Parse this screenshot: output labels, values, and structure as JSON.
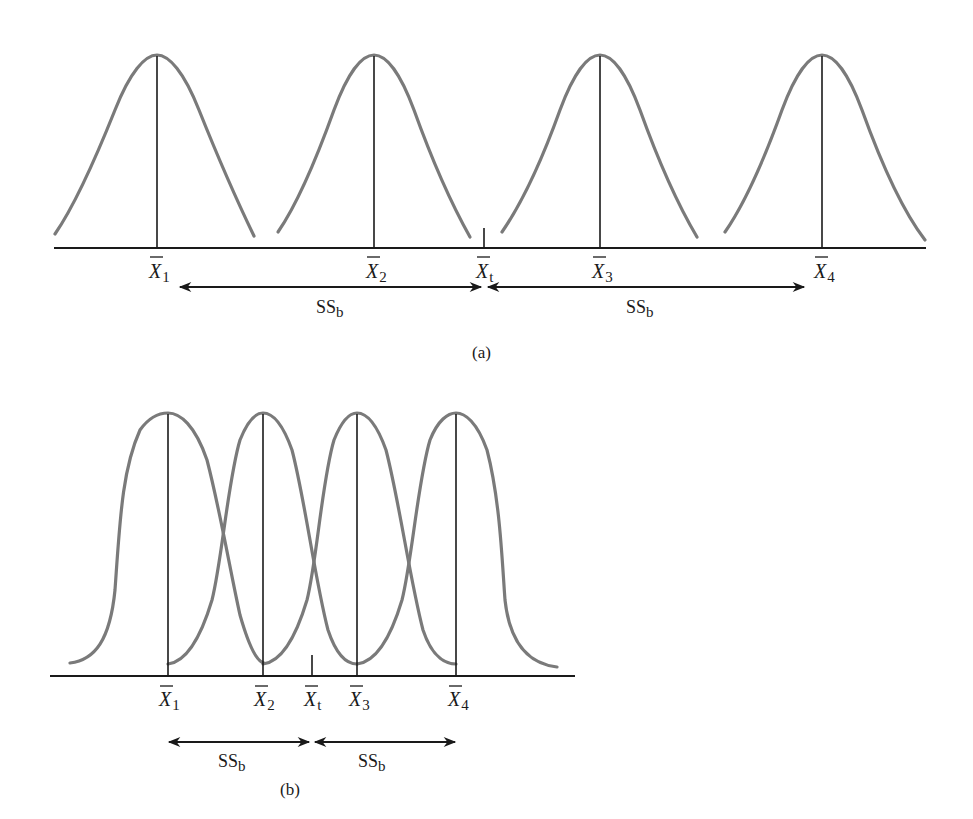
{
  "figure": {
    "panels": [
      {
        "id": "a",
        "caption": "(a)",
        "description": "Well-separated group means: large between-groups sum of squares",
        "means": [
          {
            "symbol": "X",
            "sub": "1",
            "x": 157
          },
          {
            "symbol": "X",
            "sub": "2",
            "x": 374
          },
          {
            "symbol": "X",
            "sub": "3",
            "x": 600
          },
          {
            "symbol": "X",
            "sub": "4",
            "x": 822
          }
        ],
        "grand_mean": {
          "symbol": "X",
          "sub": "t",
          "x": 484
        },
        "arrows": [
          {
            "label": "SS",
            "sub": "b",
            "from": 178,
            "to": 482
          },
          {
            "label": "SS",
            "sub": "b",
            "from": 487,
            "to": 805
          }
        ]
      },
      {
        "id": "b",
        "caption": "(b)",
        "description": "Closely spaced, overlapping group means: small between-groups sum of squares",
        "means": [
          {
            "symbol": "X",
            "sub": "1",
            "x": 168
          },
          {
            "symbol": "X",
            "sub": "2",
            "x": 263
          },
          {
            "symbol": "X",
            "sub": "3",
            "x": 357
          },
          {
            "symbol": "X",
            "sub": "4",
            "x": 456
          }
        ],
        "grand_mean": {
          "symbol": "X",
          "sub": "t",
          "x": 312
        },
        "arrows": [
          {
            "label": "SS",
            "sub": "b",
            "from": 168,
            "to": 310
          },
          {
            "label": "SS",
            "sub": "b",
            "from": 314,
            "to": 456
          }
        ]
      }
    ],
    "colors": {
      "curve": "#7a7a7a",
      "line": "#1a1a1a",
      "background": "#ffffff"
    }
  }
}
